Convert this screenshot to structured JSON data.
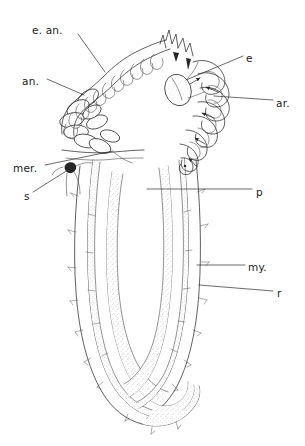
{
  "figure": {
    "type": "anatomical-line-drawing",
    "background_color": "#ffffff",
    "ink_color": "#2b2b2b",
    "stipple_color": "#8a8a8a",
    "width": 305,
    "height": 446
  },
  "labels": [
    {
      "id": "e-an",
      "text": "e. an.",
      "meaning": "external annulation",
      "x": 32,
      "y": 30,
      "anchor": "start",
      "leader": [
        [
          78,
          34
        ],
        [
          105,
          72
        ]
      ]
    },
    {
      "id": "an",
      "text": "an.",
      "meaning": "annulus",
      "x": 22,
      "y": 81,
      "anchor": "start",
      "leader": [
        [
          47,
          79
        ],
        [
          84,
          95
        ]
      ]
    },
    {
      "id": "mer",
      "text": "mer.",
      "meaning": "meridional band",
      "x": 13,
      "y": 168,
      "anchor": "start",
      "leader": [
        [
          45,
          165
        ],
        [
          113,
          151
        ]
      ]
    },
    {
      "id": "s",
      "text": "s",
      "meaning": "seta / spine",
      "x": 24,
      "y": 196,
      "anchor": "start",
      "leader": [
        [
          33,
          192
        ],
        [
          68,
          170
        ]
      ]
    },
    {
      "id": "e",
      "text": "e",
      "meaning": "eye / ocellus",
      "x": 246,
      "y": 59,
      "anchor": "start",
      "leader": [
        [
          243,
          56
        ],
        [
          186,
          80
        ]
      ]
    },
    {
      "id": "ar",
      "text": "ar.",
      "meaning": "arm / tentacle ray",
      "x": 276,
      "y": 104,
      "anchor": "start",
      "leader": [
        [
          273,
          100
        ],
        [
          214,
          96
        ]
      ]
    },
    {
      "id": "p",
      "text": "p",
      "meaning": "pharynx",
      "x": 256,
      "y": 193,
      "anchor": "start",
      "leader": [
        [
          252,
          189
        ],
        [
          147,
          189
        ]
      ]
    },
    {
      "id": "my",
      "text": "my.",
      "meaning": "myofilament layer / muscle",
      "x": 248,
      "y": 268,
      "anchor": "start",
      "leader": [
        [
          245,
          265
        ],
        [
          197,
          265
        ]
      ]
    },
    {
      "id": "r",
      "text": "r",
      "meaning": "retractor muscle",
      "x": 277,
      "y": 294,
      "anchor": "start",
      "leader": [
        [
          273,
          291
        ],
        [
          199,
          285
        ]
      ]
    }
  ],
  "regions": [
    {
      "id": "introvert-crown",
      "name": "folded tentacular crown",
      "description": "zigzag folded ribbon arch across the top"
    },
    {
      "id": "annuli-group",
      "name": "stippled annuli",
      "description": "chain of stippled ovals along the left inner arch"
    },
    {
      "id": "coil-group",
      "name": "coiled arms",
      "description": "nested loops on the right side with arrowed tips"
    },
    {
      "id": "left-arm",
      "name": "left body arm",
      "description": "elongate arm with stippled muscle band"
    },
    {
      "id": "right-arm",
      "name": "right body arm",
      "description": "elongate arm with stippled muscle band"
    },
    {
      "id": "basal-fold",
      "name": "basal U fold",
      "description": "rounded bend joining the two arms at the bottom"
    }
  ]
}
